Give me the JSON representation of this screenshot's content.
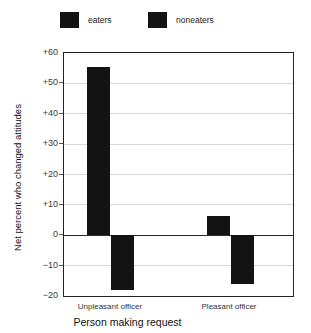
{
  "chart_data": {
    "type": "bar",
    "title": "",
    "subtitle": "",
    "xlabel": "Person making request",
    "ylabel": "Net percent who changed attitudes",
    "categories": [
      "Unpleasant officer",
      "Pleasant officer"
    ],
    "series": [
      {
        "name": "eaters",
        "color": "#131313",
        "values": [
          55.5,
          6.5
        ]
      },
      {
        "name": "noneaters",
        "color": "#131313",
        "values": [
          -18.0,
          -16.0
        ]
      }
    ],
    "ylim": [
      -20,
      60
    ],
    "ytick_values": [
      60,
      50,
      40,
      30,
      20,
      10,
      0,
      -10,
      -20
    ],
    "ytick_labels": [
      "+60",
      "+50",
      "+40",
      "+30",
      "+20",
      "+10",
      "0",
      "−10",
      "−20"
    ],
    "grid": "horizontal",
    "legend_position": "top-left",
    "zero_line": true
  },
  "legend": {
    "entries": [
      {
        "label": "eaters",
        "swatch_color": "#131313"
      },
      {
        "label": "noneaters",
        "swatch_color": "#131313"
      }
    ]
  },
  "axes": {
    "y_title": "Net percent who changed attitudes",
    "x_title": "Person making request"
  },
  "colors": {
    "bar": "#131313",
    "frame": "#222222",
    "gridline": "#d8d8d8",
    "zero_line": "#2a2a2a",
    "background": "#ffffff"
  }
}
